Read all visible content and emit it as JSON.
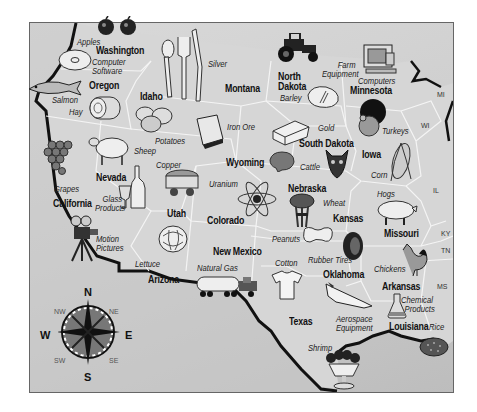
{
  "map": {
    "title": "Western and Central United States Products Map",
    "colors": {
      "land": "#d0d0d0",
      "border": "#111111",
      "state_line": "#f2f2f2",
      "frame": "#666666"
    },
    "states": [
      {
        "name": "Washington",
        "x": 80,
        "y": 39
      },
      {
        "name": "Oregon",
        "x": 89,
        "y": 81
      },
      {
        "name": "Idaho",
        "x": 140,
        "y": 91
      },
      {
        "name": "Montana",
        "x": 225,
        "y": 84
      },
      {
        "name": "North Dakota",
        "line1": "North",
        "line2": "Dakota",
        "x": 278,
        "y": 74
      },
      {
        "name": "Minnesota",
        "x": 350,
        "y": 85
      },
      {
        "name": "South Dakota",
        "x": 299,
        "y": 139
      },
      {
        "name": "Wyoming",
        "x": 226,
        "y": 158
      },
      {
        "name": "Iowa",
        "x": 362,
        "y": 150
      },
      {
        "name": "Nebraska",
        "x": 288,
        "y": 184
      },
      {
        "name": "Nevada",
        "x": 96,
        "y": 173
      },
      {
        "name": "California",
        "x": 55,
        "y": 199
      },
      {
        "name": "Utah",
        "x": 167,
        "y": 209
      },
      {
        "name": "Colorado",
        "x": 207,
        "y": 216
      },
      {
        "name": "Kansas",
        "x": 333,
        "y": 214
      },
      {
        "name": "Missouri",
        "x": 384,
        "y": 229
      },
      {
        "name": "New Mexico",
        "x": 213,
        "y": 247
      },
      {
        "name": "Arizona",
        "x": 148,
        "y": 274
      },
      {
        "name": "Oklahoma",
        "x": 323,
        "y": 270
      },
      {
        "name": "Arkansas",
        "x": 382,
        "y": 282
      },
      {
        "name": "Texas",
        "x": 289,
        "y": 317
      },
      {
        "name": "Louisiana",
        "x": 389,
        "y": 324
      }
    ],
    "state_abbreviations": [
      {
        "name": "MI",
        "x": 437,
        "y": 91
      },
      {
        "name": "WI",
        "x": 421,
        "y": 122
      },
      {
        "name": "IL",
        "x": 433,
        "y": 187
      },
      {
        "name": "KY",
        "x": 441,
        "y": 230
      },
      {
        "name": "TN",
        "x": 441,
        "y": 247
      },
      {
        "name": "MS",
        "x": 437,
        "y": 283
      }
    ],
    "products": [
      {
        "label": "Apples",
        "x": 77,
        "y": 39
      },
      {
        "label": "Computer Software",
        "line1": "Computer",
        "line2": "Software",
        "x": 92,
        "y": 56
      },
      {
        "label": "Salmon",
        "x": 52,
        "y": 96
      },
      {
        "label": "Hay",
        "x": 69,
        "y": 108
      },
      {
        "label": "Silver",
        "x": 208,
        "y": 61
      },
      {
        "label": "Farm Equipment",
        "line1": "Farm",
        "line2": "Equipment",
        "x": 324,
        "y": 61
      },
      {
        "label": "Computers",
        "x": 358,
        "y": 77
      },
      {
        "label": "Barley",
        "x": 280,
        "y": 94
      },
      {
        "label": "Potatoes",
        "x": 155,
        "y": 138
      },
      {
        "label": "Iron Ore",
        "x": 227,
        "y": 124
      },
      {
        "label": "Gold",
        "x": 318,
        "y": 122
      },
      {
        "label": "Turkeys",
        "x": 382,
        "y": 126
      },
      {
        "label": "Sheep",
        "x": 134,
        "y": 147
      },
      {
        "label": "Copper",
        "x": 156,
        "y": 161
      },
      {
        "label": "Cattle",
        "x": 300,
        "y": 163
      },
      {
        "label": "Corn",
        "x": 371,
        "y": 172
      },
      {
        "label": "Uranium",
        "x": 209,
        "y": 180
      },
      {
        "label": "Grapes",
        "x": 54,
        "y": 185
      },
      {
        "label": "Glass Products",
        "line1": "Glass",
        "line2": "Products",
        "x": 94,
        "y": 196
      },
      {
        "label": "Hogs",
        "x": 377,
        "y": 190
      },
      {
        "label": "Wheat",
        "x": 323,
        "y": 199
      },
      {
        "label": "Motion Pictures",
        "line1": "Motion",
        "line2": "Pictures",
        "x": 96,
        "y": 235
      },
      {
        "label": "Peanuts",
        "x": 272,
        "y": 235
      },
      {
        "label": "Lettuce",
        "x": 135,
        "y": 260
      },
      {
        "label": "Natural Gas",
        "x": 197,
        "y": 266
      },
      {
        "label": "Cotton",
        "x": 275,
        "y": 260
      },
      {
        "label": "Rubber Tires",
        "x": 308,
        "y": 258
      },
      {
        "label": "Chickens",
        "x": 374,
        "y": 265
      },
      {
        "label": "Chemical Products",
        "line1": "Chemical",
        "line2": "Products",
        "x": 401,
        "y": 298
      },
      {
        "label": "Aerospace Equipment",
        "line1": "Aerospace",
        "line2": "Equipment",
        "x": 336,
        "y": 316
      },
      {
        "label": "Rice",
        "x": 429,
        "y": 324
      },
      {
        "label": "Shrimp",
        "x": 308,
        "y": 345
      }
    ],
    "compass": {
      "N": "N",
      "S": "S",
      "E": "E",
      "W": "W",
      "NE": "NE",
      "NW": "NW",
      "SE": "SE",
      "SW": "SW"
    },
    "icons": [
      "apple-icon",
      "cd-disc-icon",
      "salmon-fish-icon",
      "hay-bale-icon",
      "silverware-icon",
      "tractor-icon",
      "computer-icon",
      "barley-sack-icon",
      "potatoes-icon",
      "iron-ore-ingot-icon",
      "gold-bar-icon",
      "turkey-icon",
      "sheep-icon",
      "grapes-icon",
      "wine-bottle-glass-icon",
      "copper-ore-cart-icon",
      "uranium-atom-icon",
      "cattle-steak-icon",
      "cow-icon",
      "corn-icon",
      "wheat-sheaf-icon",
      "hog-icon",
      "movie-camera-icon",
      "lettuce-icon",
      "tanker-truck-icon",
      "peanut-icon",
      "tire-icon",
      "rooster-icon",
      "t-shirt-icon",
      "space-shuttle-icon",
      "flask-icon",
      "rice-icon",
      "shrimp-cocktail-icon",
      "compass-rose-icon"
    ]
  }
}
